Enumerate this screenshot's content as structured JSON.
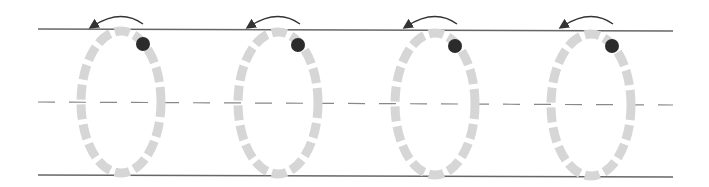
{
  "diagram": {
    "colors": {
      "line": "#666666",
      "dashed_line": "#888888",
      "loop": "#d6d6d6",
      "dot": "#2b2b2b",
      "arrow": "#333333"
    },
    "loops": [
      {
        "cx": 121,
        "cy": 102,
        "rx": 40,
        "ry": 71,
        "dot_x": 143,
        "dot_y": 44,
        "arrow": "counterclockwise"
      },
      {
        "cx": 278,
        "cy": 103,
        "rx": 40,
        "ry": 71,
        "dot_x": 298,
        "dot_y": 45,
        "arrow": "counterclockwise"
      },
      {
        "cx": 435,
        "cy": 104,
        "rx": 40,
        "ry": 71,
        "dot_x": 455,
        "dot_y": 46,
        "arrow": "counterclockwise"
      },
      {
        "cx": 591,
        "cy": 105,
        "rx": 40,
        "ry": 71,
        "dot_x": 612,
        "dot_y": 46,
        "arrow": "counterclockwise"
      }
    ]
  }
}
